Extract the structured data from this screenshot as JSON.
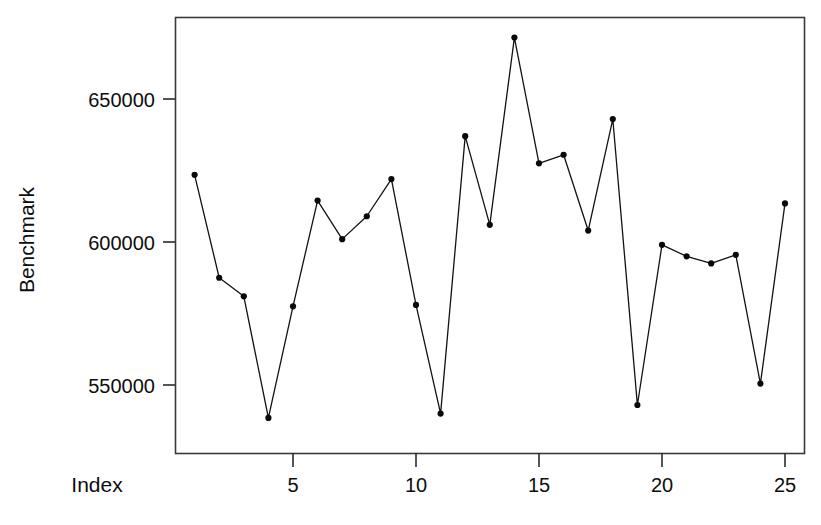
{
  "chart_data": {
    "type": "line",
    "title": "",
    "subtitle": "",
    "xlabel": "Index",
    "ylabel": "Benchmark",
    "x": [
      1,
      2,
      3,
      4,
      5,
      6,
      7,
      8,
      9,
      10,
      11,
      12,
      13,
      14,
      15,
      16,
      17,
      18,
      19,
      20,
      21,
      22,
      23,
      24,
      25
    ],
    "values": [
      623500,
      587500,
      581000,
      538500,
      577500,
      614500,
      601000,
      609000,
      622000,
      578000,
      540000,
      637000,
      606000,
      671500,
      627500,
      630500,
      604000,
      643000,
      543000,
      599000,
      595000,
      592500,
      595500,
      550500,
      613500
    ],
    "series": [
      {
        "name": "Benchmark",
        "values": [
          623500,
          587500,
          581000,
          538500,
          577500,
          614500,
          601000,
          609000,
          622000,
          578000,
          540000,
          637000,
          606000,
          671500,
          627500,
          630500,
          604000,
          643000,
          543000,
          599000,
          595000,
          592500,
          595500,
          550500,
          613500
        ]
      }
    ],
    "xlim": [
      0.3,
      25.7
    ],
    "ylim": [
      527000,
      679000
    ],
    "xticks": [
      5,
      10,
      15,
      20,
      25
    ],
    "xtick_labels": [
      "5",
      "10",
      "15",
      "20",
      "25"
    ],
    "yticks": [
      550000,
      600000,
      650000
    ],
    "ytick_labels": [
      "550000",
      "600000",
      "650000"
    ],
    "grid": false,
    "legend": false,
    "legend_position": "none",
    "marker": "filled-circle",
    "line_style": "solid",
    "line_color": "#121212",
    "marker_color": "#0a0a0a",
    "background_color": "#ffffff",
    "frame": "box"
  },
  "axes": {
    "x_axis_label": "Index",
    "y_axis_label": "Benchmark"
  }
}
